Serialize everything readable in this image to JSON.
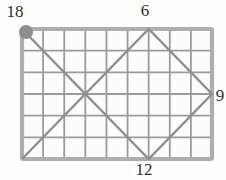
{
  "figure": {
    "grid": {
      "cols": 9,
      "rows": 6
    },
    "rect": {
      "x": 22,
      "y": 29,
      "w": 190,
      "h": 130
    },
    "colors": {
      "cell_fill": "#fcfcfc",
      "grid_line": "#9b9b9b",
      "border": "#aeaeae",
      "path": "#8f8f8f",
      "dot": "#8d8d8d",
      "label_text": "#2e2e2e"
    },
    "path": {
      "vertices": [
        [
          0,
          0
        ],
        [
          6,
          6
        ],
        [
          9,
          3
        ],
        [
          6,
          0
        ],
        [
          0,
          6
        ]
      ]
    },
    "dot": {
      "col": 0,
      "row": 0,
      "dx": 4,
      "dy": 3,
      "radius": 7
    },
    "labels": [
      {
        "id": "start",
        "text": "18",
        "x": 15,
        "y": 11
      },
      {
        "id": "top-bounce",
        "text": "6",
        "x": 145,
        "y": 10
      },
      {
        "id": "right-bounce",
        "text": "9",
        "x": 220,
        "y": 95
      },
      {
        "id": "bottom-bounce",
        "text": "12",
        "x": 144,
        "y": 169
      }
    ]
  }
}
